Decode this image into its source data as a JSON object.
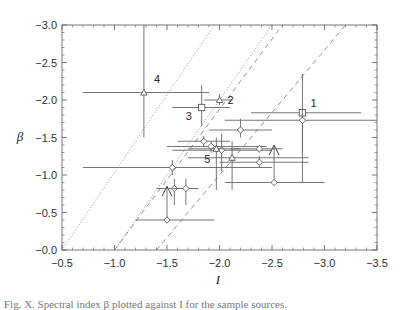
{
  "chart_data": {
    "type": "scatter",
    "title": "",
    "xlabel": "I",
    "ylabel": "β",
    "xlim": [
      -0.5,
      -3.5
    ],
    "ylim": [
      -0.0,
      -3.0
    ],
    "x_ticks": [
      "-0.5",
      "-1.0",
      "-1.5",
      "-2.0",
      "-2.5",
      "-3.0",
      "-3.5"
    ],
    "y_ticks": [
      "-0.0",
      "-0.5",
      "-1.0",
      "-1.5",
      "-2.0",
      "-2.5",
      "-3.0"
    ],
    "grid": false,
    "legend": null,
    "reference_lines": [
      {
        "style": "dotted",
        "from": [
          -0.5,
          0.0
        ],
        "to": [
          -1.95,
          -3.0
        ]
      },
      {
        "style": "dotted",
        "from": [
          -1.0,
          0.0
        ],
        "to": [
          -2.5,
          -3.0
        ]
      },
      {
        "style": "dashed",
        "from": [
          -1.0,
          0.0
        ],
        "to": [
          -2.6,
          -3.0
        ]
      },
      {
        "style": "dashed",
        "from": [
          -1.4,
          0.0
        ],
        "to": [
          -3.2,
          -3.0
        ]
      }
    ],
    "points": [
      {
        "label": "4",
        "marker": "triangle",
        "x": -1.28,
        "y": -2.1,
        "xerr": [
          -0.7,
          -1.9
        ],
        "yerr": [
          -1.5,
          -3.0
        ]
      },
      {
        "label": "3",
        "marker": "square",
        "x": -1.83,
        "y": -1.9,
        "xerr": [
          -1.55,
          -2.1
        ],
        "yerr": [
          -1.65,
          -2.2
        ]
      },
      {
        "label": "2",
        "marker": "triangle",
        "x": -2.0,
        "y": -2.0,
        "xerr": [
          -1.85,
          -2.12
        ],
        "yerr": [
          -1.93,
          -2.08
        ]
      },
      {
        "label": "1",
        "marker": "square",
        "x": -2.79,
        "y": -1.83,
        "xerr": [
          -2.3,
          -3.35
        ],
        "yerr": [
          -1.3,
          -2.35
        ]
      },
      {
        "label": "",
        "marker": "diamond",
        "x": -2.79,
        "y": -1.73,
        "xerr": [
          -2.05,
          -3.5
        ],
        "yerr": [
          -0.9,
          -1.9
        ]
      },
      {
        "label": "",
        "marker": "diamond",
        "x": -2.2,
        "y": -1.6,
        "xerr": [
          -1.9,
          -2.5
        ],
        "yerr": [
          -1.5,
          -1.75
        ]
      },
      {
        "label": "",
        "marker": "diamond",
        "x": -1.85,
        "y": -1.45,
        "xerr": [
          -1.6,
          -2.1
        ],
        "yerr": [
          -1.38,
          -1.52
        ]
      },
      {
        "label": "",
        "marker": "diamond",
        "x": -1.92,
        "y": -1.38,
        "xerr": [
          -1.5,
          -2.45
        ],
        "yerr": [
          -1.3,
          -1.45
        ]
      },
      {
        "label": "",
        "marker": "diamond",
        "x": -2.02,
        "y": -1.33,
        "xerr": [
          -1.55,
          -2.5
        ],
        "yerr": [
          -1.05,
          -1.55
        ]
      },
      {
        "label": "5",
        "marker": "triangle",
        "x": -1.97,
        "y": -1.35,
        "xerr": [
          -1.7,
          -2.2
        ],
        "yerr": [
          -0.8,
          -1.5
        ]
      },
      {
        "label": "",
        "marker": "diamond",
        "x": -2.38,
        "y": -1.35,
        "xerr": [
          -2.1,
          -2.6
        ],
        "yerr": [
          -1.3,
          -1.4
        ]
      },
      {
        "label": "",
        "marker": "triangle",
        "x": -2.12,
        "y": -1.23,
        "xerr": [
          -1.7,
          -2.85
        ],
        "yerr": [
          -0.8,
          -1.45
        ]
      },
      {
        "label": "",
        "marker": "diamond",
        "x": -2.38,
        "y": -1.17,
        "xerr": [
          -2.0,
          -2.85
        ],
        "yerr": [
          -1.1,
          -1.25
        ]
      },
      {
        "label": "",
        "marker": "diamond",
        "x": -1.55,
        "y": -1.1,
        "xerr": [
          -0.7,
          -2.5
        ],
        "yerr": [
          -1.0,
          -1.2
        ]
      },
      {
        "label": "",
        "marker": "upper-limit-arrow",
        "x": -2.52,
        "y": -0.9,
        "xerr": [
          -2.05,
          -3.0
        ],
        "yerr": [
          -0.9,
          -1.4
        ]
      },
      {
        "label": "",
        "marker": "upper-limit-arrow",
        "x": -1.5,
        "y": -0.4,
        "xerr": [
          -1.2,
          -1.95
        ],
        "yerr": [
          -0.4,
          -0.85
        ]
      },
      {
        "label": "",
        "marker": "diamond",
        "x": -1.57,
        "y": -0.82,
        "xerr": [
          -1.4,
          -1.75
        ],
        "yerr": [
          -0.6,
          -0.95
        ]
      },
      {
        "label": "",
        "marker": "diamond",
        "x": -1.68,
        "y": -0.82,
        "xerr": [
          -1.55,
          -1.8
        ],
        "yerr": [
          -0.6,
          -0.95
        ]
      }
    ]
  },
  "caption_text": "Fig. X. Spectral index β plotted against I for the sample sources."
}
